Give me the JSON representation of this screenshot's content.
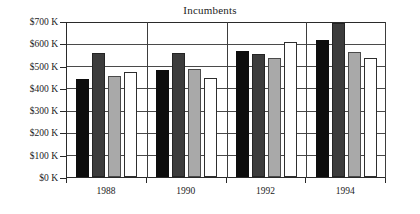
{
  "chart_data": {
    "type": "bar",
    "title": "Incumbents",
    "xlabel": "",
    "ylabel": "",
    "categories": [
      "1988",
      "1990",
      "1992",
      "1994"
    ],
    "series": [
      {
        "name": "series-1",
        "color": "#0d0d0d",
        "values": [
          440000,
          480000,
          565000,
          615000
        ]
      },
      {
        "name": "series-2",
        "color": "#3c3c3c",
        "values": [
          555000,
          555000,
          550000,
          690000
        ]
      },
      {
        "name": "series-3",
        "color": "#a9a9a9",
        "values": [
          455000,
          485000,
          535000,
          560000
        ]
      },
      {
        "name": "series-4",
        "color": "#ffffff",
        "values": [
          470000,
          445000,
          605000,
          535000
        ]
      }
    ],
    "ylim": [
      0,
      700000
    ],
    "ytick_values": [
      0,
      100000,
      200000,
      300000,
      400000,
      500000,
      600000,
      700000
    ],
    "ytick_labels": [
      "$0 K",
      "$100 K",
      "$200 K",
      "$300 K",
      "$400 K",
      "$500 K",
      "$600 K",
      "$700 K"
    ],
    "grid": true,
    "legend": "none"
  }
}
